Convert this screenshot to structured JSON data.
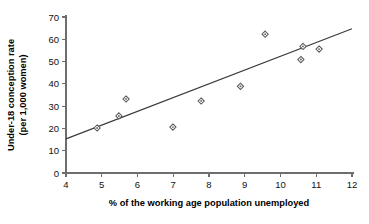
{
  "chart_data": {
    "type": "scatter",
    "title": "",
    "xlabel": "% of the working age population unemployed",
    "ylabel": "Under-18 conception rate\n(per 1,000 women)",
    "ylabel_line1": "Under-18 conception rate",
    "ylabel_line2": "(per 1,000 women)",
    "xlim": [
      4,
      12
    ],
    "ylim": [
      0,
      70
    ],
    "xticks": [
      4,
      5,
      6,
      7,
      8,
      9,
      10,
      11,
      12
    ],
    "yticks": [
      0,
      10,
      20,
      30,
      40,
      50,
      60,
      70
    ],
    "xtick_labels": [
      "4",
      "5",
      "6",
      "7",
      "8",
      "9",
      "10",
      "11",
      "12"
    ],
    "ytick_labels": [
      "0",
      "10",
      "20",
      "30",
      "40",
      "50",
      "60",
      "70"
    ],
    "grid": false,
    "legend": "none",
    "marker": "open-diamond-with-dot",
    "point_color": "#5a5a5a",
    "line_color": "#3a3a3a",
    "axis_color": "#6e6e6e",
    "points": [
      {
        "x": 4.87,
        "y": 20.2
      },
      {
        "x": 5.48,
        "y": 25.6
      },
      {
        "x": 5.68,
        "y": 33.2
      },
      {
        "x": 6.99,
        "y": 20.6
      },
      {
        "x": 7.78,
        "y": 32.3
      },
      {
        "x": 8.88,
        "y": 38.9
      },
      {
        "x": 9.57,
        "y": 62.3
      },
      {
        "x": 10.57,
        "y": 50.9
      },
      {
        "x": 10.63,
        "y": 56.8
      },
      {
        "x": 11.08,
        "y": 55.6
      }
    ],
    "trendline": {
      "type": "linear",
      "x_start": 4.0,
      "y_start": 15.3,
      "x_end": 12.0,
      "y_end": 64.7
    }
  }
}
